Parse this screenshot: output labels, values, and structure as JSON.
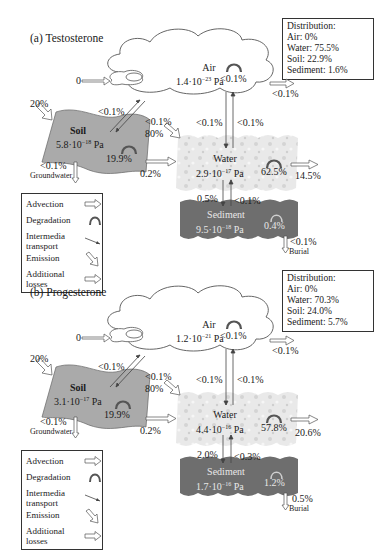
{
  "panels": [
    {
      "id": "a",
      "title": "(a) Testosterone",
      "distribution": {
        "heading": "Distribution:",
        "air": "Air: 0%",
        "water": "Water: 75.5%",
        "soil": "Soil: 22.9%",
        "sediment": "Sediment: 1.6%"
      },
      "air": {
        "label": "Air",
        "fugacity": "1.4·10",
        "exp": "−23",
        "unit": " Pa",
        "degradation": "<0.1%",
        "advection_in": "0",
        "advection_out": "<0.1%"
      },
      "soil": {
        "label": "Soil",
        "fugacity": "5.8·10",
        "exp": "−18",
        "unit": " Pa",
        "degradation": "19.9%",
        "emission": "20%",
        "groundwater_loss": "<0.1%",
        "groundwater_label": "Groundwater",
        "to_water": "0.2%"
      },
      "water": {
        "label": "Water",
        "fugacity": "2.9·10",
        "exp": "−17",
        "unit": " Pa",
        "degradation": "62.5%",
        "emission": "80%",
        "advection_out": "14.5%"
      },
      "sediment": {
        "label": "Sediment",
        "fugacity": "9.5·10",
        "exp": "−18",
        "unit": " Pa",
        "degradation": "0.4%",
        "burial": "<0.1%",
        "burial_label": "Burial"
      },
      "transfers": {
        "soil_to_air": "<0.1%",
        "air_to_soil": "<0.1%",
        "air_to_water": "<0.1%",
        "water_to_air": "<0.1%",
        "water_to_sediment": "0.5%",
        "sediment_to_water": "<0.1%"
      }
    },
    {
      "id": "b",
      "title": "(b) Progesterone",
      "distribution": {
        "heading": "Distribution:",
        "air": "Air: 0%",
        "water": "Water: 70.3%",
        "soil": "Soil: 24.0%",
        "sediment": "Sediment: 5.7%"
      },
      "air": {
        "label": "Air",
        "fugacity": "1.2·10",
        "exp": "−21",
        "unit": " Pa",
        "degradation": "<0.1%",
        "advection_in": "0",
        "advection_out": "<0.1%"
      },
      "soil": {
        "label": "Soil",
        "fugacity": "3.1·10",
        "exp": "−17",
        "unit": " Pa",
        "degradation": "19.9%",
        "emission": "20%",
        "groundwater_loss": "<0.1%",
        "groundwater_label": "Groundwater",
        "to_water": "0.2%"
      },
      "water": {
        "label": "Water",
        "fugacity": "4.4·10",
        "exp": "−16",
        "unit": " Pa",
        "degradation": "57.8%",
        "emission": "80%",
        "advection_out": "20.6%"
      },
      "sediment": {
        "label": "Sediment",
        "fugacity": "1.7·10",
        "exp": "−16",
        "unit": " Pa",
        "degradation": "1.2%",
        "burial": "0.5%",
        "burial_label": "Burial"
      },
      "transfers": {
        "soil_to_air": "<0.1%",
        "air_to_soil": "<0.1%",
        "air_to_water": "<0.1%",
        "water_to_air": "<0.1%",
        "water_to_sediment": "2.0%",
        "sediment_to_water": "<0.3%"
      }
    }
  ],
  "legend": {
    "advection": "Advection",
    "degradation": "Degradation",
    "intermedia_1": "Intermedia",
    "intermedia_2": "transport",
    "emission": "Emission",
    "additional_1": "Additional",
    "additional_2": "losses"
  },
  "colors": {
    "soil": "#a9a9a9",
    "water": "#e6e6e6",
    "sediment": "#6e6e6e",
    "air": "#ffffff",
    "stroke": "#333333"
  }
}
